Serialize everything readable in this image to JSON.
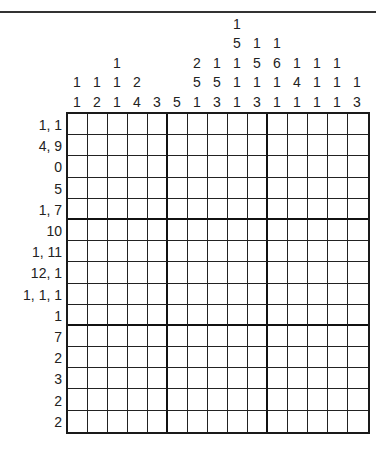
{
  "puzzle": {
    "type": "nonogram",
    "size": {
      "rows": 15,
      "cols": 15
    },
    "column_clues": [
      [
        "1",
        "1"
      ],
      [
        "1",
        "2"
      ],
      [
        "1",
        "1",
        "1"
      ],
      [
        "2",
        "4"
      ],
      [
        "3"
      ],
      [
        "5"
      ],
      [
        "2",
        "5",
        "1"
      ],
      [
        "1",
        "5",
        "3"
      ],
      [
        "1",
        "5",
        "1",
        "1",
        "1"
      ],
      [
        "1",
        "5",
        "1",
        "3"
      ],
      [
        "1",
        "6",
        "1",
        "1"
      ],
      [
        "1",
        "4",
        "1"
      ],
      [
        "1",
        "1",
        "1"
      ],
      [
        "1",
        "1",
        "1"
      ],
      [
        "1",
        "3"
      ]
    ],
    "row_clues": [
      "1, 1",
      "4, 9",
      "0",
      "5",
      "1, 7",
      "10",
      "1, 11",
      "12, 1",
      "1, 1, 1",
      "1",
      "7",
      "2",
      "3",
      "2",
      "2"
    ],
    "colors": {
      "line": "#222222",
      "background": "#ffffff",
      "text": "#222222"
    }
  }
}
